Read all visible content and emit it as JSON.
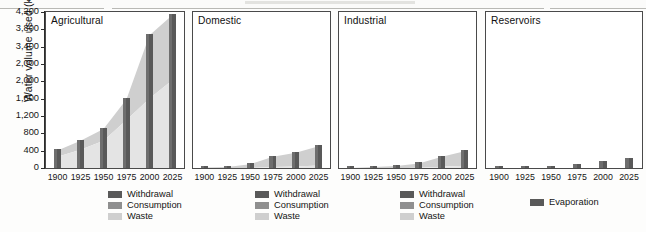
{
  "figure": {
    "ylabel": "Water volume used (km³)",
    "y_ticks": [
      "4,200",
      "3,800",
      "3,400",
      "2,000",
      "2,000",
      "1,600",
      "1,200",
      "800",
      "400",
      "0"
    ],
    "x_ticks": [
      "1900",
      "1925",
      "1950",
      "1975",
      "2000",
      "2025"
    ]
  },
  "colors": {
    "withdrawal": "#595959",
    "consumption": "#8f8f8f",
    "waste": "#cfcfcf",
    "evaporation": "#595959",
    "axis": "#2b2b2b",
    "panel_border": "#4a4a4a",
    "background": "#fdfdfc"
  },
  "legends": {
    "standard": [
      {
        "label": "Withdrawal",
        "color": "#595959"
      },
      {
        "label": "Consumption",
        "color": "#8f8f8f"
      },
      {
        "label": "Waste",
        "color": "#cfcfcf"
      }
    ],
    "reservoirs": [
      {
        "label": "Evaporation",
        "color": "#595959"
      }
    ]
  },
  "chart_data": {
    "type": "bar",
    "title": "",
    "xlabel": "",
    "ylabel": "Water volume used (km³)",
    "ylim": [
      0,
      4200
    ],
    "ytick_values": [
      4200,
      3733,
      3267,
      2800,
      2333,
      1867,
      1400,
      933,
      467,
      0
    ],
    "ytick_labels": [
      "4,200",
      "3,800",
      "3,400",
      "2,000",
      "2,000",
      "1,600",
      "1,200",
      "800",
      "400",
      "0"
    ],
    "grid": false,
    "legend_position": "below-panel",
    "categories": [
      "1900",
      "1925",
      "1950",
      "1975",
      "2000",
      "2025"
    ],
    "panels": [
      {
        "name": "Agricultural",
        "series": [
          {
            "name": "Withdrawal",
            "values": [
              500,
              760,
              1080,
              1880,
              3600,
              4150
            ]
          },
          {
            "name": "Consumption",
            "values": [
              330,
              520,
              760,
              1320,
              1900,
              2400
            ]
          },
          {
            "name": "Waste",
            "values": [
              170,
              240,
              320,
              560,
              1700,
              1750
            ]
          }
        ]
      },
      {
        "name": "Domestic",
        "series": [
          {
            "name": "Withdrawal",
            "values": [
              40,
              55,
              130,
              330,
              440,
              610
            ]
          },
          {
            "name": "Consumption",
            "values": [
              10,
              15,
              30,
              55,
              70,
              95
            ]
          },
          {
            "name": "Waste",
            "values": [
              30,
              40,
              100,
              275,
              370,
              515
            ]
          }
        ]
      },
      {
        "name": "Industrial",
        "series": [
          {
            "name": "Withdrawal",
            "values": [
              30,
              50,
              80,
              150,
              330,
              480
            ]
          },
          {
            "name": "Consumption",
            "values": [
              8,
              12,
              20,
              35,
              60,
              85
            ]
          },
          {
            "name": "Waste",
            "values": [
              22,
              38,
              60,
              115,
              270,
              395
            ]
          }
        ]
      },
      {
        "name": "Reservoirs",
        "series": [
          {
            "name": "Evaporation",
            "values": [
              10,
              15,
              30,
              105,
              195,
              260
            ]
          }
        ]
      }
    ]
  }
}
